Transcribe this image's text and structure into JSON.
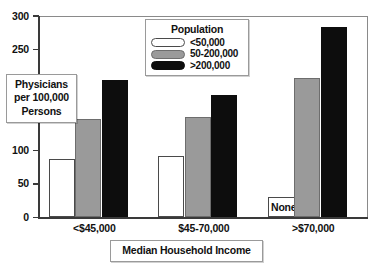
{
  "chart_data": {
    "type": "bar",
    "title": "",
    "xlabel": "Median Household Income",
    "ylabel": "Physicians per 100,000 Persons",
    "ylabel_lines": [
      "Physicians",
      "per 100,000",
      "Persons"
    ],
    "categories": [
      "<$45,000",
      "$45-70,000",
      ">$70,000"
    ],
    "ylim": [
      0,
      300
    ],
    "yticks": [
      0,
      50,
      100,
      150,
      200,
      250,
      300
    ],
    "ytick_labels": [
      "0",
      "50",
      "100",
      "150",
      "200",
      "250",
      "300"
    ],
    "ytick_visible": [
      true,
      true,
      true,
      true,
      false,
      true,
      true
    ],
    "grid": false,
    "legend": {
      "title": "Population",
      "position": "top-center",
      "entries": [
        {
          "label": "<50,000",
          "color": "#ffffff"
        },
        {
          "label": "50-200,000",
          "color": "#9a9a9a"
        },
        {
          "label": ">200,000",
          "color": "#0d0d0d"
        }
      ]
    },
    "series": [
      {
        "name": "<50,000",
        "color": "#ffffff",
        "values": [
          87,
          92,
          null
        ],
        "value_labels": [
          "",
          "",
          "None"
        ]
      },
      {
        "name": "50-200,000",
        "color": "#9a9a9a",
        "values": [
          147,
          149,
          208
        ],
        "value_labels": [
          "",
          "",
          ""
        ]
      },
      {
        "name": ">200,000",
        "color": "#0d0d0d",
        "values": [
          205,
          182,
          284
        ],
        "value_labels": [
          "",
          "",
          ""
        ]
      }
    ],
    "annotations": [
      {
        "text": "None",
        "category": ">$70,000",
        "series": "<50,000"
      }
    ]
  }
}
